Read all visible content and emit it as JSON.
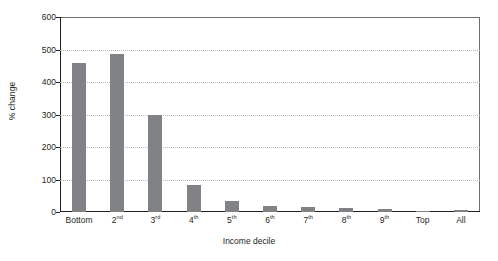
{
  "chart_data": {
    "type": "bar",
    "title": "",
    "xlabel": "Income decile",
    "ylabel": "% change",
    "categories": [
      "Bottom",
      "2nd",
      "3rd",
      "4th",
      "5th",
      "6th",
      "7th",
      "8th",
      "9th",
      "Top",
      "All"
    ],
    "category_labels": [
      {
        "base": "Bottom",
        "sup": ""
      },
      {
        "base": "2",
        "sup": "nd"
      },
      {
        "base": "3",
        "sup": "rd"
      },
      {
        "base": "4",
        "sup": "th"
      },
      {
        "base": "5",
        "sup": "th"
      },
      {
        "base": "6",
        "sup": "th"
      },
      {
        "base": "7",
        "sup": "th"
      },
      {
        "base": "8",
        "sup": "th"
      },
      {
        "base": "9",
        "sup": "th"
      },
      {
        "base": "Top",
        "sup": ""
      },
      {
        "base": "All",
        "sup": ""
      }
    ],
    "values": [
      457,
      485,
      300,
      83,
      33,
      19,
      15,
      12,
      8,
      1,
      5
    ],
    "ylim": [
      0,
      600
    ],
    "yticks": [
      0,
      100,
      200,
      300,
      400,
      500,
      600
    ],
    "ytick_labels": [
      "0",
      "100",
      "200",
      "300",
      "400",
      "500",
      "600"
    ],
    "grid": true,
    "legend": "none",
    "bar_color": "#808285",
    "axis_color": "#231f20",
    "gridline_color": "#b8b8b8"
  }
}
